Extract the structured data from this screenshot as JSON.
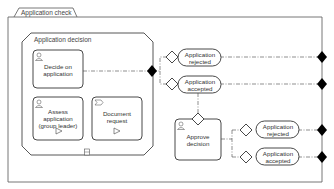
{
  "pool": {
    "title": "Application check"
  },
  "subprocess": {
    "title": "Application decision"
  },
  "tasks": [
    {
      "id": "decide",
      "label": "Decide on application",
      "type": "user-task"
    },
    {
      "id": "assess",
      "label": "Assess application (group leader)",
      "type": "user-task"
    },
    {
      "id": "docreq",
      "label": "Document request",
      "type": "send-task"
    },
    {
      "id": "approve",
      "label": "Approve decision",
      "type": "user-task"
    }
  ],
  "events": [
    {
      "id": "ev1",
      "label": "Application rejected"
    },
    {
      "id": "ev2",
      "label": "Application accepted"
    },
    {
      "id": "ev3",
      "label": "Application rejected"
    },
    {
      "id": "ev4",
      "label": "Application accepted"
    }
  ],
  "colors": {
    "line": "#555555",
    "fill": "#ffffff",
    "connector": "#000000"
  }
}
